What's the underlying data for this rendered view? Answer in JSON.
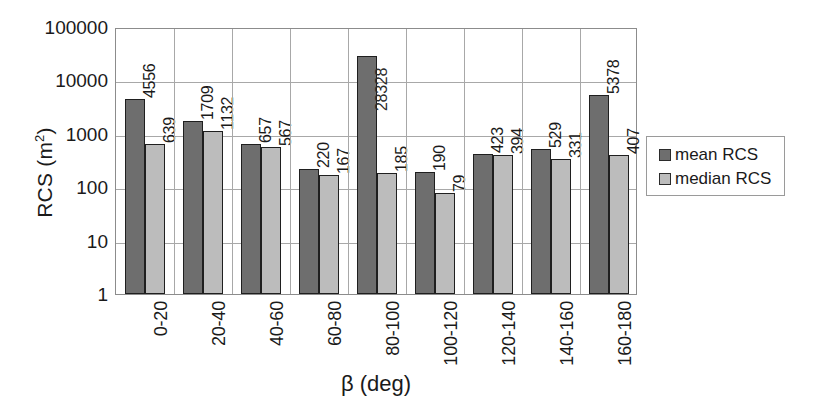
{
  "chart_data": {
    "type": "bar",
    "title": "",
    "xlabel": "β (deg)",
    "ylabel": "RCS (m²)",
    "ylabel_base": "RCS (m",
    "ylabel_sup": "2",
    "ylabel_tail": ")",
    "yscale": "log",
    "ylim": [
      1,
      100000
    ],
    "ytick_labels": [
      "100000",
      "10000",
      "1000",
      "100",
      "10",
      "1"
    ],
    "ytick_values": [
      100000,
      10000,
      1000,
      100,
      10,
      1
    ],
    "grid": "horizontal-and-vertical",
    "legend_position": "right",
    "categories": [
      "0-20",
      "20-40",
      "40-60",
      "60-80",
      "80-100",
      "100-120",
      "120-140",
      "140-160",
      "160-180"
    ],
    "series": [
      {
        "name": "mean RCS",
        "color": "#6e6e6e",
        "values": [
          4556,
          1709,
          657,
          220,
          28328,
          190,
          423,
          529,
          5378
        ],
        "labels": [
          "4556",
          "1709",
          "657",
          "220",
          "28328",
          "190",
          "423",
          "529",
          "5378"
        ]
      },
      {
        "name": "median RCS",
        "color": "#bcbcbc",
        "values": [
          639,
          1132,
          567,
          167,
          185,
          79,
          394,
          331,
          407
        ],
        "labels": [
          "639",
          "1132",
          "567",
          "167",
          "185",
          "79",
          "394",
          "331",
          "407"
        ]
      }
    ]
  },
  "legend": {
    "entries": [
      {
        "label": "mean RCS"
      },
      {
        "label": "median RCS"
      }
    ]
  },
  "axes": {
    "x_title": "β (deg)",
    "y_title_prefix": "RCS (m",
    "y_title_sup": "2",
    "y_title_suffix": ")"
  },
  "colors": {
    "mean_bar": "#6e6e6e",
    "median_bar": "#bcbcbc",
    "bar_outline": "#1f1f1f",
    "grid": "#a8a8a8",
    "axis_frame": "#8c8c8c",
    "text": "#1a1a1a",
    "background": "#ffffff"
  }
}
